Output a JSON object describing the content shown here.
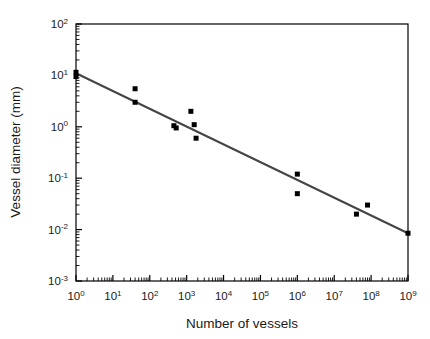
{
  "chart_data": {
    "type": "scatter",
    "title": "",
    "xlabel": "Number of vessels",
    "ylabel": "Vessel diameter (mm)",
    "xscale": "log",
    "yscale": "log",
    "xlim": [
      1,
      1000000000
    ],
    "ylim": [
      0.001,
      100
    ],
    "grid": false,
    "legend": false,
    "xticks": [
      1,
      10,
      100,
      1000,
      10000,
      100000,
      1000000,
      10000000,
      100000000,
      1000000000
    ],
    "xtick_labels": [
      "10^0",
      "10^1",
      "10^2",
      "10^3",
      "10^4",
      "10^5",
      "10^6",
      "10^7",
      "10^8",
      "10^9"
    ],
    "xtick_mantissas": [
      "10",
      "10",
      "10",
      "10",
      "10",
      "10",
      "10",
      "10",
      "10",
      "10"
    ],
    "xtick_exponents": [
      "0",
      "1",
      "2",
      "3",
      "4",
      "5",
      "6",
      "7",
      "8",
      "9"
    ],
    "yticks": [
      0.001,
      0.01,
      0.1,
      1,
      10,
      100
    ],
    "ytick_labels": [
      "10^-3",
      "10^-2",
      "10^-1",
      "10^0",
      "10^1",
      "10^2"
    ],
    "ytick_mantissas": [
      "10",
      "10",
      "10",
      "10",
      "10",
      "10"
    ],
    "ytick_exponents": [
      "-3",
      "-2",
      "-1",
      "0",
      "1",
      "2"
    ],
    "minor_ticks": true,
    "marker": "square",
    "marker_color": "#000000",
    "marker_size_px": 5,
    "points": [
      {
        "x": 1,
        "y": 11.5
      },
      {
        "x": 1,
        "y": 9.5
      },
      {
        "x": 40,
        "y": 5.5
      },
      {
        "x": 40,
        "y": 3.0
      },
      {
        "x": 450,
        "y": 1.05
      },
      {
        "x": 520,
        "y": 0.95
      },
      {
        "x": 1300,
        "y": 2.0
      },
      {
        "x": 1600,
        "y": 1.1
      },
      {
        "x": 1800,
        "y": 0.6
      },
      {
        "x": 1000000,
        "y": 0.12
      },
      {
        "x": 1000000,
        "y": 0.05
      },
      {
        "x": 40000000,
        "y": 0.02
      },
      {
        "x": 80000000,
        "y": 0.03
      },
      {
        "x": 1000000000,
        "y": 0.0085
      }
    ],
    "fit_line": {
      "color": "#444444",
      "width_px": 2,
      "x_start": 1,
      "y_start": 11.0,
      "x_end": 1000000000,
      "y_end": 0.0085,
      "slope_per_decade": -0.3492
    },
    "frame_color": "#000000",
    "background": "#ffffff"
  }
}
